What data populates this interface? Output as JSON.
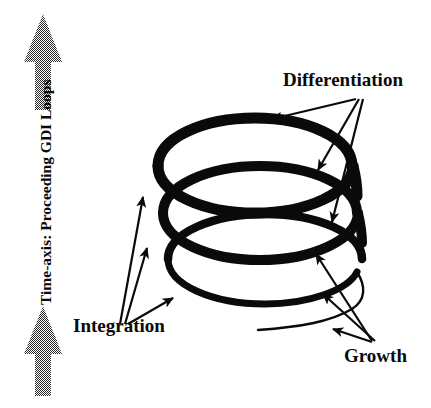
{
  "figure": {
    "title_visible": false,
    "background_color": "#ffffff",
    "ink_color": "#0a0a0a",
    "axis_arrow_color": "#808080",
    "axis": {
      "label": "Time-axis: Proceeding GDI Loops",
      "orientation": "vertical",
      "direction": "upward",
      "arrow_top_name": "axis-arrow-up-top",
      "arrow_bottom_name": "axis-arrow-up-bottom"
    },
    "spiral": {
      "name": "gdi-spiral-coil",
      "loop_count": 3,
      "description": "Three-turn helical coil drawn in thick black stroke"
    },
    "annotations": [
      {
        "id": "differentiation",
        "label": "Differentiation",
        "arrow_count": 3,
        "position": "top-right"
      },
      {
        "id": "integration",
        "label": "Integration",
        "arrow_count": 3,
        "position": "bottom-left"
      },
      {
        "id": "growth",
        "label": "Growth",
        "arrow_count": 3,
        "position": "bottom-right"
      }
    ]
  }
}
